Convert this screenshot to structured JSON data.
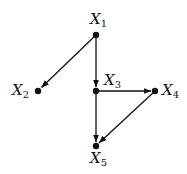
{
  "diagram": {
    "type": "directed-graph",
    "nodes": [
      {
        "id": "X1",
        "name": "X",
        "sub": "1",
        "x": 96,
        "y": 35
      },
      {
        "id": "X2",
        "name": "X",
        "sub": "2",
        "x": 38,
        "y": 91
      },
      {
        "id": "X3",
        "name": "X",
        "sub": "3",
        "x": 96,
        "y": 91
      },
      {
        "id": "X4",
        "name": "X",
        "sub": "4",
        "x": 155,
        "y": 91
      },
      {
        "id": "X5",
        "name": "X",
        "sub": "5",
        "x": 96,
        "y": 146
      }
    ],
    "edges": [
      {
        "from": "X1",
        "to": "X2"
      },
      {
        "from": "X1",
        "to": "X3"
      },
      {
        "from": "X3",
        "to": "X4"
      },
      {
        "from": "X3",
        "to": "X5"
      },
      {
        "from": "X4",
        "to": "X5"
      }
    ],
    "colors": {
      "ink": "#111111",
      "background": "#ffffff"
    }
  }
}
